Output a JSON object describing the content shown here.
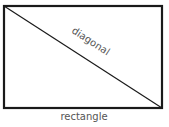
{
  "diagram": {
    "shapes": [
      {
        "type": "rectangle",
        "label": "rectangle"
      },
      {
        "type": "line",
        "label": "diagonal"
      }
    ],
    "rectangle_label": "rectangle",
    "diagonal_label": "diagonal",
    "colors": {
      "stroke": "#1a1a1a",
      "text": "#555555",
      "background": "#ffffff"
    }
  }
}
